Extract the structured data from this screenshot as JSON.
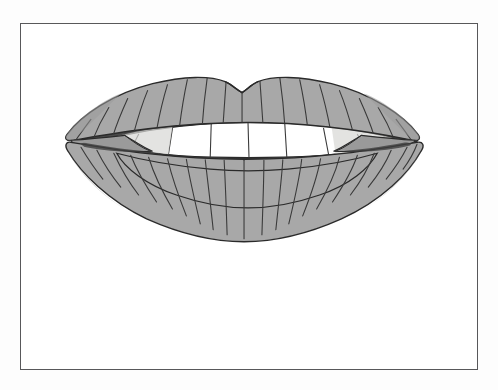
{
  "figure": {
    "title": "Smiling mouth line drawing",
    "style": "grayscale clip-art line illustration",
    "caption": "",
    "frame": {
      "border_color": "#58585a",
      "border_width_px": 1.4,
      "fill_color": "#ffffff",
      "x": 20,
      "y": 23,
      "width": 458,
      "height": 347
    },
    "page_background": "#fdfdfd",
    "colors": {
      "lip_fill": "#a8a8a8",
      "lip_fill_light": "#b4b4b4",
      "lip_fill_shadow": "#9a9a9a",
      "outline": "#2a2a2a",
      "crease_line": "#3a3a3a",
      "mouth_interior_dark": "#4a4a4a",
      "mouth_interior_shadow": "#5e5e5e",
      "upper_teeth": "#ffffff",
      "lower_teeth": "#e8e8e6",
      "lower_teeth_shadow": "#d6d6d2",
      "tooth_divider": "#3a3a3a"
    },
    "parts": [
      {
        "name": "upper-lip",
        "label": "Upper lip",
        "fill": "#a8a8a8",
        "crease_count": 17
      },
      {
        "name": "lower-lip",
        "label": "Lower lip",
        "fill": "#a8a8a8",
        "crease_count": 20
      },
      {
        "name": "mouth-interior",
        "label": "Mouth interior",
        "fill": "#4a4a4a"
      },
      {
        "name": "upper-teeth",
        "label": "Upper teeth",
        "fill": "#ffffff",
        "tooth_count": 6
      },
      {
        "name": "lower-teeth",
        "label": "Lower teeth",
        "fill": "#e8e8e6",
        "tooth_count": 7
      },
      {
        "name": "cupids-bow",
        "label": "Cupid's bow notch",
        "fill": "#a8a8a8"
      },
      {
        "name": "left-mouth-corner",
        "label": "Left mouth corner",
        "fill": "#9a9a9a"
      },
      {
        "name": "right-mouth-corner",
        "label": "Right mouth corner",
        "fill": "#9a9a9a"
      }
    ]
  }
}
